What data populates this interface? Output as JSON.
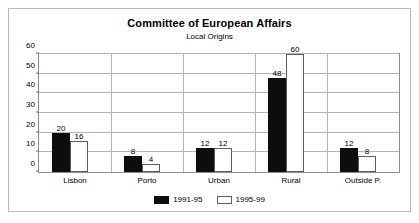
{
  "chart_data": {
    "type": "bar",
    "title": "Committee of European Affairs",
    "subtitle": "Local Origins",
    "xlabel": "",
    "ylabel": "",
    "ylim": [
      0,
      60
    ],
    "yticks": [
      0,
      10,
      20,
      30,
      40,
      50,
      60
    ],
    "grid": true,
    "legend_position": "bottom-center",
    "categories": [
      "Lisbon",
      "Porto",
      "Urban",
      "Rural",
      "Outside P."
    ],
    "series": [
      {
        "name": "1991-95",
        "color": "#0d0d0d",
        "values": [
          20,
          8,
          12,
          48,
          12
        ]
      },
      {
        "name": "1995-99",
        "color": "#ffffff",
        "values": [
          16,
          4,
          12,
          60,
          8
        ]
      }
    ],
    "data_labels": [
      [
        "20",
        "16"
      ],
      [
        "8",
        "4"
      ],
      [
        "12",
        "12"
      ],
      [
        "48",
        "60"
      ],
      [
        "12",
        "8"
      ]
    ]
  }
}
